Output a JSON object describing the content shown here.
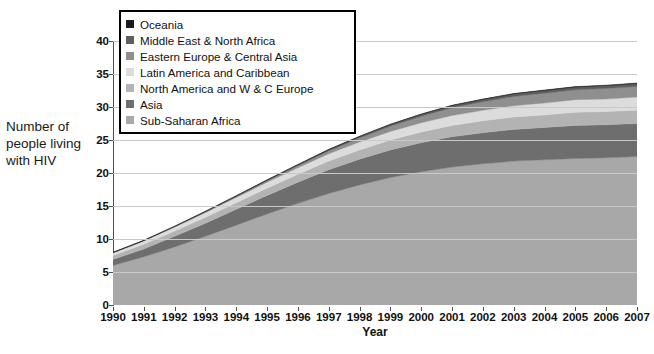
{
  "axis": {
    "left_caption": "Number of people living with HIV",
    "y_unit_label": "Millions",
    "x_title": "Year",
    "y_ticks": [
      "0",
      "5",
      "10",
      "15",
      "20",
      "25",
      "30",
      "35",
      "40"
    ],
    "x_ticks": [
      "1990",
      "1991",
      "1992",
      "1993",
      "1994",
      "1995",
      "1996",
      "1997",
      "1998",
      "1999",
      "2000",
      "2001",
      "2002",
      "2003",
      "2004",
      "2005",
      "2006",
      "2007"
    ]
  },
  "legend": {
    "items": [
      {
        "label": "Oceania",
        "color": "#1a1a1a"
      },
      {
        "label": "Middle East & North Africa",
        "color": "#5e5e5e"
      },
      {
        "label": "Eastern Europe & Central Asia",
        "color": "#8f8f8f"
      },
      {
        "label": "Latin America and Caribbean",
        "color": "#dcdcdc"
      },
      {
        "label": "North America and W & C Europe",
        "color": "#b3b3b3"
      },
      {
        "label": "Asia",
        "color": "#6e6e6e"
      },
      {
        "label": "Sub-Saharan Africa",
        "color": "#a8a8a8"
      }
    ]
  },
  "caption": "",
  "chart_data": {
    "type": "area",
    "title": "",
    "subtitle": "",
    "xlabel": "Year",
    "ylabel": "Millions",
    "ylim": [
      0,
      40
    ],
    "grid": true,
    "stacked": true,
    "legend_position": "top-left",
    "annotations": [
      "Number of people living with HIV"
    ],
    "categories": [
      "1990",
      "1991",
      "1992",
      "1993",
      "1994",
      "1995",
      "1996",
      "1997",
      "1998",
      "1999",
      "2000",
      "2001",
      "2002",
      "2003",
      "2004",
      "2005",
      "2006",
      "2007"
    ],
    "x": [
      1990,
      1991,
      1992,
      1993,
      1994,
      1995,
      1996,
      1997,
      1998,
      1999,
      2000,
      2001,
      2002,
      2003,
      2004,
      2005,
      2006,
      2007
    ],
    "stack_order_bottom_to_top": [
      "Sub-Saharan Africa",
      "Asia",
      "North America and W & C Europe",
      "Latin America and Caribbean",
      "Eastern Europe & Central Asia",
      "Middle East & North Africa",
      "Oceania"
    ],
    "series": [
      {
        "name": "Sub-Saharan Africa",
        "color": "#a8a8a8",
        "values": [
          6.0,
          7.3,
          8.8,
          10.4,
          12.1,
          13.8,
          15.4,
          16.9,
          18.2,
          19.3,
          20.2,
          20.9,
          21.4,
          21.8,
          22.0,
          22.2,
          22.3,
          22.5
        ]
      },
      {
        "name": "Asia",
        "color": "#6e6e6e",
        "values": [
          0.9,
          1.2,
          1.6,
          2.0,
          2.4,
          2.8,
          3.2,
          3.6,
          3.9,
          4.2,
          4.4,
          4.6,
          4.7,
          4.8,
          4.9,
          5.0,
          5.0,
          5.0
        ]
      },
      {
        "name": "North America and W & C Europe",
        "color": "#b3b3b3",
        "values": [
          0.6,
          0.7,
          0.8,
          0.9,
          1.0,
          1.1,
          1.2,
          1.3,
          1.4,
          1.5,
          1.6,
          1.7,
          1.8,
          1.9,
          1.9,
          2.0,
          2.0,
          2.0
        ]
      },
      {
        "name": "Latin America and Caribbean",
        "color": "#dcdcdc",
        "values": [
          0.4,
          0.5,
          0.6,
          0.7,
          0.8,
          0.9,
          1.0,
          1.1,
          1.2,
          1.3,
          1.4,
          1.5,
          1.6,
          1.7,
          1.8,
          1.9,
          1.9,
          2.0
        ]
      },
      {
        "name": "Eastern Europe & Central Asia",
        "color": "#8f8f8f",
        "values": [
          0.02,
          0.03,
          0.05,
          0.08,
          0.12,
          0.2,
          0.3,
          0.45,
          0.6,
          0.8,
          1.0,
          1.2,
          1.3,
          1.4,
          1.5,
          1.5,
          1.6,
          1.6
        ]
      },
      {
        "name": "Middle East & North Africa",
        "color": "#5e5e5e",
        "values": [
          0.05,
          0.06,
          0.08,
          0.1,
          0.12,
          0.14,
          0.17,
          0.2,
          0.23,
          0.26,
          0.29,
          0.32,
          0.35,
          0.38,
          0.4,
          0.42,
          0.44,
          0.45
        ]
      },
      {
        "name": "Oceania",
        "color": "#1a1a1a",
        "values": [
          0.01,
          0.01,
          0.01,
          0.02,
          0.02,
          0.02,
          0.03,
          0.03,
          0.04,
          0.04,
          0.05,
          0.05,
          0.06,
          0.06,
          0.07,
          0.07,
          0.07,
          0.08
        ]
      }
    ],
    "totals": [
      7.98,
      9.8,
      11.94,
      14.2,
      16.56,
      18.96,
      21.3,
      23.58,
      25.57,
      27.36,
      28.94,
      30.27,
      31.21,
      31.94,
      32.57,
      33.09,
      33.31,
      33.63
    ]
  }
}
